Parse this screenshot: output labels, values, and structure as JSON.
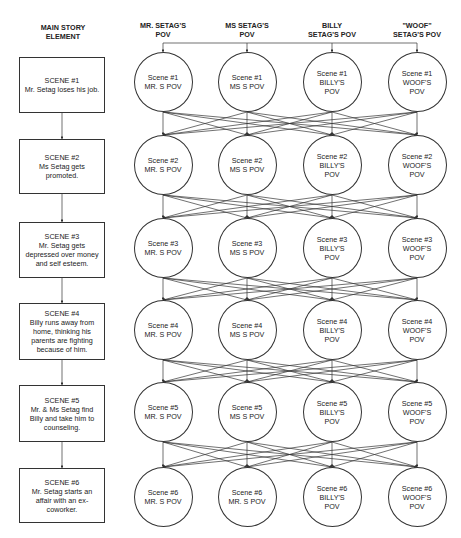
{
  "headers": {
    "main": "MAIN STORY\nELEMENT",
    "columns": [
      {
        "key": "mr",
        "label": "MR. SETAG'S\nPOV"
      },
      {
        "key": "ms",
        "label": "MS SETAG'S\nPOV"
      },
      {
        "key": "billy",
        "label": "BILLY\nSETAG'S POV"
      },
      {
        "key": "woof",
        "label": "\"WOOF\"\nSETAG'S POV"
      }
    ]
  },
  "main_story": [
    {
      "title": "SCENE #1",
      "desc": "Mr. Setag loses his job."
    },
    {
      "title": "SCENE #2",
      "desc": "Ms Setag gets\npromoted."
    },
    {
      "title": "SCENE #3",
      "desc": "Mr. Setag gets\ndepressed over money\nand self esteem."
    },
    {
      "title": "SCENE #4",
      "desc": "Billy runs away from\nhome, thinking his\nparents are fighting\nbecause of him."
    },
    {
      "title": "SCENE #5",
      "desc": "Mr. & Ms Setag find\nBilly and take him to\ncounseling."
    },
    {
      "title": "SCENE #6",
      "desc": "Mr. Setag starts an\naffair with an ex-\ncoworker."
    }
  ],
  "pov_grid": [
    [
      {
        "scene": "Scene #1",
        "pov": "MR. S POV"
      },
      {
        "scene": "Scene #1",
        "pov": "MS S POV"
      },
      {
        "scene": "Scene #1",
        "pov": "BILLY'S\nPOV"
      },
      {
        "scene": "Scene #1",
        "pov": "WOOF'S\nPOV"
      }
    ],
    [
      {
        "scene": "Scene #2",
        "pov": "MR. S POV"
      },
      {
        "scene": "Scene #2",
        "pov": "MS S POV"
      },
      {
        "scene": "Scene #2",
        "pov": "BILLY'S\nPOV"
      },
      {
        "scene": "Scene #2",
        "pov": "WOOF'S\nPOV"
      }
    ],
    [
      {
        "scene": "Scene #3",
        "pov": "MR. S POV"
      },
      {
        "scene": "Scene #3",
        "pov": "MS S POV"
      },
      {
        "scene": "Scene #3",
        "pov": "BILLY'S\nPOV"
      },
      {
        "scene": "Scene #3",
        "pov": "WOOF'S\nPOV"
      }
    ],
    [
      {
        "scene": "Scene #4",
        "pov": "MR. S POV"
      },
      {
        "scene": "Scene #4",
        "pov": "MS S POV"
      },
      {
        "scene": "Scene #4",
        "pov": "BILLY'S\nPOV"
      },
      {
        "scene": "Scene #4",
        "pov": "WOOF'S\nPOV"
      }
    ],
    [
      {
        "scene": "Scene #5",
        "pov": "MR. S POV"
      },
      {
        "scene": "Scene #5",
        "pov": "MS S POV"
      },
      {
        "scene": "Scene #5",
        "pov": "BILLY'S\nPOV"
      },
      {
        "scene": "Scene #5",
        "pov": "WOOF'S\nPOV"
      }
    ],
    [
      {
        "scene": "Scene #6",
        "pov": "MR. S POV"
      },
      {
        "scene": "Scene #6",
        "pov": "MR. S POV"
      },
      {
        "scene": "Scene #6",
        "pov": "BILLY'S\nPOV"
      },
      {
        "scene": "Scene #6",
        "pov": "WOOF'S\nPOV"
      }
    ]
  ],
  "edges": {
    "main_story_flow": "sequential",
    "pov_flow": "all-to-all between consecutive scenes",
    "header_bus": "single horizontal line feeding all four Scene #1 nodes"
  },
  "colors": {
    "line": "#333333",
    "text": "#222222",
    "background": "#ffffff"
  }
}
